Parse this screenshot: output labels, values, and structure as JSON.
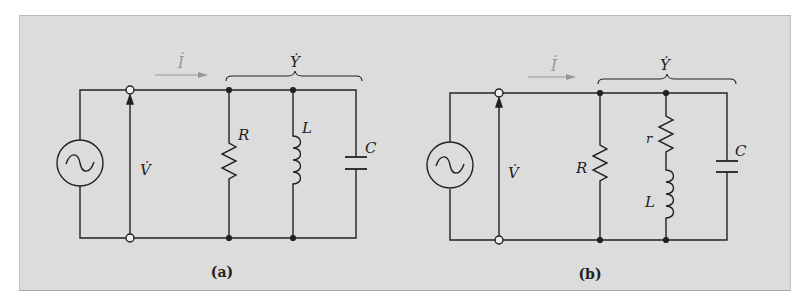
{
  "figure": {
    "background_color": "#dcdcdc",
    "wire_color": "#222222",
    "current_arrow_color": "#999999"
  },
  "circuits": [
    {
      "caption": "(a)",
      "current_label": "İ",
      "admittance_label": "Ẏ",
      "voltage_label": "V̇",
      "source": "ac-voltage-source",
      "branches": [
        {
          "label": "R",
          "element": "resistor"
        },
        {
          "label": "L",
          "element": "inductor"
        },
        {
          "label": "C",
          "element": "capacitor"
        }
      ]
    },
    {
      "caption": "(b)",
      "current_label": "İ",
      "admittance_label": "Ẏ",
      "voltage_label": "V̇",
      "source": "ac-voltage-source",
      "branches": [
        {
          "label": "R",
          "element": "resistor"
        },
        {
          "label_r": "r",
          "label_L": "L",
          "element": "resistor-inductor-series"
        },
        {
          "label": "C",
          "element": "capacitor"
        }
      ]
    }
  ]
}
